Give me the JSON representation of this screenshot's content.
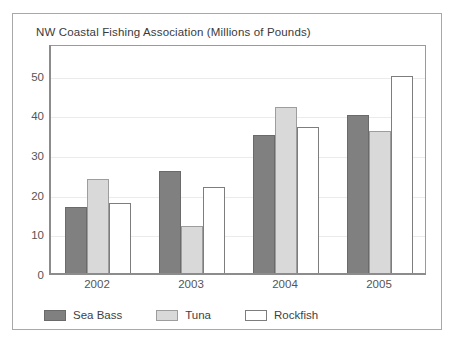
{
  "chart_data": {
    "type": "bar",
    "title": "NW Coastal Fishing Association (Millions of Pounds)",
    "xlabel": "",
    "ylabel": "",
    "categories": [
      "2002",
      "2003",
      "2004",
      "2005"
    ],
    "series": [
      {
        "name": "Sea Bass",
        "values": [
          17,
          26,
          35,
          40
        ],
        "color": "#808080"
      },
      {
        "name": "Tuna",
        "values": [
          24,
          12,
          42,
          36
        ],
        "color": "#d9d9d9"
      },
      {
        "name": "Rockfish",
        "values": [
          18,
          22,
          37,
          50
        ],
        "color": "#ffffff"
      }
    ],
    "ylim": [
      0,
      58
    ],
    "yticks": [
      0,
      10,
      20,
      30,
      40,
      50
    ],
    "ytick_labels": [
      "0",
      "10",
      "20",
      "30",
      "40",
      "50"
    ],
    "grid": true,
    "grid_axis": "y",
    "legend_position": "bottom-left",
    "bar_grouping": "grouped"
  },
  "legend": {
    "items": [
      {
        "label": "Sea Bass",
        "swatch": "seabass"
      },
      {
        "label": "Tuna",
        "swatch": "tuna"
      },
      {
        "label": "Rockfish",
        "swatch": "rockfish"
      }
    ]
  },
  "colors": {
    "sea_bass": "#808080",
    "tuna": "#d9d9d9",
    "rockfish": "#ffffff",
    "grid": "#ebebeb",
    "axis": "#8c8c8c",
    "frame": "#a8a8a8",
    "text": "#3f3f3f"
  }
}
